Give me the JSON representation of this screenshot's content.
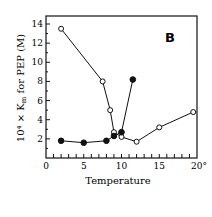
{
  "chart_data": {
    "type": "line",
    "title": "",
    "panel_label": "B",
    "xlabel": "Temperature",
    "ylabel": "10⁴ × K_m for PEP (M)",
    "ylabel_display": "10⁴ × K",
    "ylabel_sub": "m",
    "ylabel_rest": " for PEP (M)",
    "xlim": [
      0,
      20
    ],
    "ylim": [
      0,
      14
    ],
    "x_ticks": [
      "0",
      "5",
      "10",
      "15",
      "20°"
    ],
    "y_ticks": [
      "2",
      "4",
      "6",
      "8",
      "10",
      "12",
      "14"
    ],
    "grid": false,
    "series": [
      {
        "name": "open circles",
        "marker": "open-circle",
        "x": [
          2,
          7.5,
          8.5,
          9,
          10,
          12,
          15,
          19.5
        ],
        "y": [
          13.5,
          8.0,
          5.0,
          2.7,
          2.2,
          1.7,
          3.2,
          4.8
        ]
      },
      {
        "name": "filled circles",
        "marker": "filled-circle",
        "x": [
          2,
          5,
          8,
          9,
          10,
          11.5
        ],
        "y": [
          1.8,
          1.6,
          1.8,
          2.3,
          2.7,
          8.2
        ]
      }
    ]
  }
}
